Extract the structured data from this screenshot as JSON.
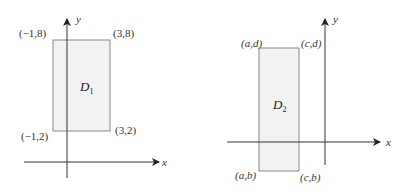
{
  "diagrams": [
    {
      "id": "left",
      "region_name": "D",
      "region_subscript": "1",
      "axis_labels": {
        "x": "x",
        "y": "y"
      },
      "corners": {
        "top_left": "(−1,8)",
        "top_right": "(3,8)",
        "bottom_left": "(−1,2)",
        "bottom_right": "(3,2)"
      },
      "fill_color": "#f2f2f2",
      "stroke_color": "#888888"
    },
    {
      "id": "right",
      "region_name": "D",
      "region_subscript": "2",
      "axis_labels": {
        "x": "x",
        "y": "y"
      },
      "corners": {
        "top_left": "(a,d)",
        "top_right": "(c,d)",
        "bottom_left": "(a,b)",
        "bottom_right": "(c,b)"
      },
      "fill_color": "#f2f2f2",
      "stroke_color": "#888888"
    }
  ],
  "colors": {
    "axis": "#333333",
    "background": "#ffffff"
  }
}
